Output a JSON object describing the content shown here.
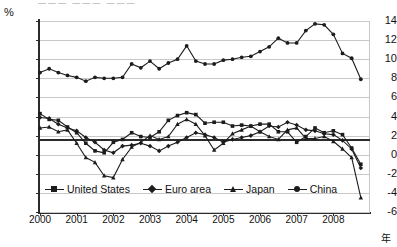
{
  "header": {
    "cropped_title": "———   ———   ———"
  },
  "axes": {
    "y_unit_label": "%",
    "x_unit_label": "年",
    "y_ticks": [
      14,
      12,
      10,
      8,
      6,
      4,
      2,
      0,
      -2,
      -4,
      -6
    ],
    "x_ticks": [
      "2000",
      "2001",
      "2002",
      "2003",
      "2004",
      "2005",
      "2006",
      "2007",
      "2008"
    ]
  },
  "legend": {
    "position": "inside-bottom-center",
    "entries": [
      {
        "label": "United States",
        "marker": "square"
      },
      {
        "label": "Euro area",
        "marker": "diamond"
      },
      {
        "label": "Japan",
        "marker": "triangle"
      },
      {
        "label": "China",
        "marker": "circle"
      }
    ]
  },
  "chart_data": {
    "type": "line",
    "title": "",
    "xlabel": "年",
    "ylabel": "%",
    "ylim": [
      -6,
      14
    ],
    "xlim": [
      2000,
      2009
    ],
    "grid": true,
    "reference_line": 1.6,
    "x": [
      2000.0,
      2000.25,
      2000.5,
      2000.75,
      2001.0,
      2001.25,
      2001.5,
      2001.75,
      2002.0,
      2002.25,
      2002.5,
      2002.75,
      2003.0,
      2003.25,
      2003.5,
      2003.75,
      2004.0,
      2004.25,
      2004.5,
      2004.75,
      2005.0,
      2005.25,
      2005.5,
      2005.75,
      2006.0,
      2006.25,
      2006.5,
      2006.75,
      2007.0,
      2007.25,
      2007.5,
      2007.75,
      2008.0,
      2008.25,
      2008.5,
      2008.75
    ],
    "x_tick_labels": [
      "2000",
      "2001",
      "2002",
      "2003",
      "2004",
      "2005",
      "2006",
      "2007",
      "2008"
    ],
    "series": [
      {
        "name": "United States",
        "marker": "square",
        "values": [
          4.3,
          3.7,
          3.6,
          2.9,
          2.3,
          1.2,
          0.4,
          0.2,
          1.3,
          1.6,
          2.3,
          1.9,
          1.8,
          2.4,
          3.6,
          4.1,
          4.4,
          4.2,
          3.3,
          3.4,
          3.4,
          3.0,
          3.1,
          3.0,
          3.2,
          3.2,
          2.4,
          2.4,
          1.3,
          1.9,
          2.8,
          2.3,
          2.5,
          2.1,
          0.7,
          -1.0
        ]
      },
      {
        "name": "Euro area",
        "marker": "diamond",
        "values": [
          3.9,
          3.8,
          3.2,
          2.8,
          2.5,
          1.8,
          1.3,
          0.5,
          0.2,
          0.9,
          1.0,
          1.2,
          0.9,
          0.4,
          0.9,
          1.3,
          1.8,
          2.3,
          2.1,
          1.8,
          1.3,
          1.6,
          1.8,
          2.0,
          2.4,
          3.0,
          2.9,
          3.4,
          3.1,
          2.6,
          2.5,
          2.2,
          2.1,
          1.5,
          0.6,
          -1.4
        ]
      },
      {
        "name": "Japan",
        "marker": "triangle",
        "values": [
          2.8,
          2.9,
          2.4,
          2.6,
          1.2,
          -0.3,
          -0.8,
          -2.2,
          -2.4,
          -0.5,
          0.8,
          1.3,
          2.0,
          1.6,
          1.9,
          3.2,
          3.7,
          3.2,
          2.0,
          0.5,
          1.2,
          2.2,
          2.6,
          3.0,
          2.4,
          1.9,
          1.6,
          2.6,
          2.8,
          1.7,
          1.7,
          1.9,
          1.4,
          0.6,
          -0.3,
          -4.5
        ]
      },
      {
        "name": "China",
        "marker": "circle",
        "values": [
          8.6,
          9.0,
          8.6,
          8.3,
          8.1,
          7.7,
          8.1,
          8.0,
          8.0,
          8.1,
          9.5,
          9.1,
          9.8,
          9.0,
          9.6,
          10.0,
          11.4,
          9.8,
          9.5,
          9.5,
          9.9,
          10.0,
          10.2,
          10.3,
          10.8,
          11.3,
          12.2,
          11.7,
          11.7,
          13.0,
          13.7,
          13.6,
          12.6,
          10.6,
          10.1,
          7.9
        ]
      }
    ]
  }
}
